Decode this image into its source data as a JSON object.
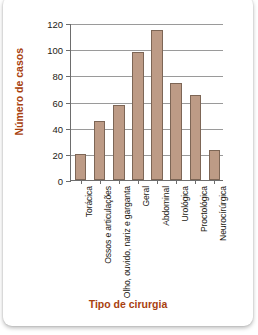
{
  "card": {
    "cropped_heading": "",
    "background_color": "#ffffff"
  },
  "colors": {
    "bar_fill": "#bd9b86",
    "bar_stroke": "#7d6656",
    "axis": "#6d6d6d",
    "gridline": "#9a9a9a",
    "axis_title": "#a8410f",
    "tick_label": "#231a14"
  },
  "chart_data": {
    "type": "bar",
    "title": "",
    "xlabel": "Tipo de cirurgia",
    "ylabel": "Número de casos",
    "categories": [
      "Torácica",
      "Ossos e articulações",
      "Olho, ouvido, nariz e garganta",
      "Geral",
      "Abdominal",
      "Urológica",
      "Proctológica",
      "Neurocírúrgica"
    ],
    "values": [
      20,
      45,
      57,
      98,
      115,
      74,
      65,
      23
    ],
    "ylim": [
      0,
      120
    ],
    "yticks": [
      0,
      20,
      40,
      60,
      80,
      100,
      120
    ],
    "ytick_labels": [
      "0",
      "20",
      "40",
      "60",
      "80",
      "100",
      "120"
    ],
    "grid": true,
    "legend": false,
    "legend_position": "none"
  }
}
